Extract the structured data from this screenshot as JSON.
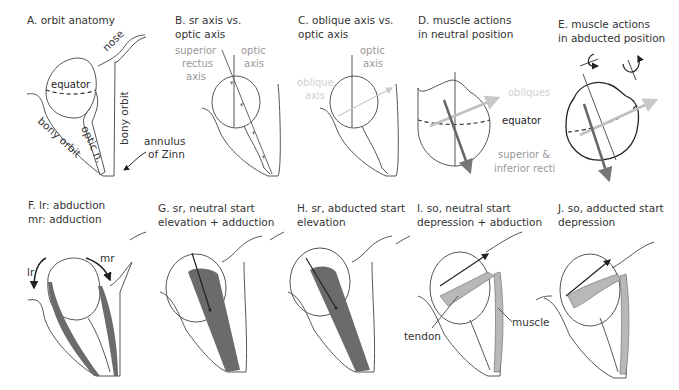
{
  "colors": {
    "outline": "#555555",
    "muscle_dark": "#6b6b6b",
    "muscle_light": "#b8b8b8",
    "axis_gray": "#888888",
    "oblique_light": "#c8c8c8",
    "label_gray": "#999999"
  },
  "panels": {
    "A": {
      "title": "A. orbit anatomy",
      "labels": {
        "nose": "nose",
        "equator": "equator",
        "bony_orbit_left": "bony orbit",
        "bony_orbit_right": "bony orbit",
        "optic_n": "optic n.",
        "annulus1": "annulus",
        "annulus2": "of Zinn"
      }
    },
    "B": {
      "title1": "B. sr axis vs.",
      "title2": "optic axis",
      "labels": {
        "sr1": "superior",
        "sr2": "rectus",
        "sr3": "axis",
        "opt1": "optic",
        "opt2": "axis"
      }
    },
    "C": {
      "title1": "C. oblique axis vs.",
      "title2": "optic axis",
      "labels": {
        "obl1": "oblique",
        "obl2": "axis",
        "opt1": "optic",
        "opt2": "axis"
      }
    },
    "D": {
      "title1": "D. muscle actions",
      "title2": "in neutral position",
      "labels": {
        "obliques": "obliques",
        "equator": "equator",
        "recti1": "superior &",
        "recti2": "inferior recti"
      }
    },
    "E": {
      "title1": "E. muscle actions",
      "title2": "in abducted position"
    },
    "F": {
      "title1": "F. lr: abduction",
      "title2": "mr: adduction",
      "labels": {
        "lr": "lr",
        "mr": "mr"
      }
    },
    "G": {
      "title1": "G. sr, neutral start",
      "title2": "elevation + adduction"
    },
    "H": {
      "title1": "H. sr, abducted start",
      "title2": "elevation"
    },
    "I": {
      "title1": "I. so, neutral start",
      "title2": "depression + abduction",
      "labels": {
        "tendon": "tendon",
        "muscle": "muscle"
      }
    },
    "J": {
      "title1": "J. so, adducted start",
      "title2": "depression"
    }
  }
}
